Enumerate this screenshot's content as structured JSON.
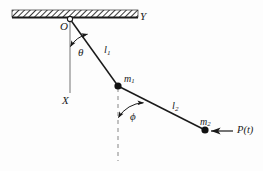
{
  "figure": {
    "type": "double-pendulum-schematic",
    "background_color": "#fdfdfd",
    "ink_color": "#1a1a1a",
    "labels": {
      "pivot": "O",
      "axis_vertical": "X",
      "axis_horizontal": "Y",
      "angle_upper": "θ",
      "angle_lower": "ϕ",
      "length_upper_base": "l",
      "length_upper_sub": "1",
      "length_lower_base": "l",
      "length_lower_sub": "2",
      "mass_upper_base": "m",
      "mass_upper_sub": "1",
      "mass_lower_base": "m",
      "mass_lower_sub": "2",
      "force": "P(t)"
    },
    "geometry": {
      "ceiling_x0": 12,
      "ceiling_x1": 138,
      "ceiling_y": 17,
      "pivot_x": 70,
      "pivot_y": 19,
      "mass1_x": 118,
      "mass1_y": 86,
      "mass2_x": 205,
      "mass2_y": 130,
      "vertical_axis_end_y": 93,
      "dashed_end_y": 160,
      "force_arrow_tail_x": 233,
      "force_arrow_head_x": 212,
      "force_arrow_y": 131
    }
  }
}
